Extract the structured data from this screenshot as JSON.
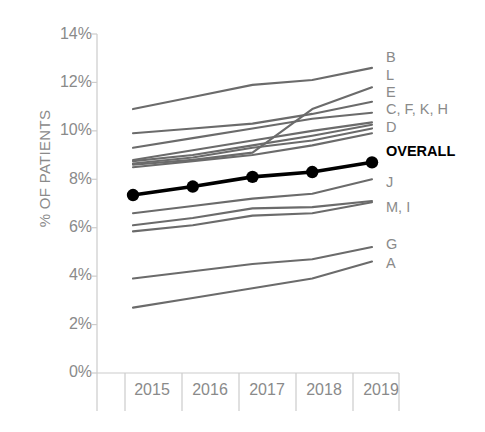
{
  "chart_data": {
    "type": "line",
    "title": "",
    "xlabel": "",
    "ylabel": "% OF PATIENTS",
    "categories": [
      "2015",
      "2016",
      "2017",
      "2018",
      "2019"
    ],
    "x": [
      2015,
      2016,
      2017,
      2018,
      2019
    ],
    "ylim": [
      0,
      14
    ],
    "ytick_labels": [
      "0%",
      "2%",
      "4%",
      "6%",
      "8%",
      "10%",
      "12%",
      "14%"
    ],
    "ytick_values": [
      0,
      2,
      4,
      6,
      8,
      10,
      12,
      14
    ],
    "grid": false,
    "legend_position": "right-inline-labels",
    "units": "percent",
    "series": [
      {
        "name": "B",
        "label": "B",
        "values": [
          10.9,
          11.4,
          11.9,
          12.1,
          12.6
        ],
        "color": "#6b6b6b",
        "highlight": false
      },
      {
        "name": "L",
        "label": "L",
        "values": [
          8.6,
          8.8,
          9.1,
          10.9,
          11.8
        ],
        "color": "#6b6b6b",
        "highlight": false
      },
      {
        "name": "E",
        "label": "E",
        "values": [
          9.9,
          10.1,
          10.3,
          10.7,
          11.2
        ],
        "color": "#6b6b6b",
        "highlight": false
      },
      {
        "name": "C",
        "label": "C, F, K, H",
        "values": [
          9.3,
          9.7,
          10.1,
          10.5,
          10.75
        ],
        "color": "#6b6b6b",
        "highlight": false
      },
      {
        "name": "F",
        "label": "",
        "values": [
          8.8,
          9.2,
          9.6,
          10.0,
          10.35
        ],
        "color": "#6b6b6b",
        "highlight": false
      },
      {
        "name": "K",
        "label": "",
        "values": [
          8.75,
          9.0,
          9.4,
          9.8,
          10.25
        ],
        "color": "#6b6b6b",
        "highlight": false
      },
      {
        "name": "H",
        "label": "",
        "values": [
          8.65,
          8.9,
          9.3,
          9.6,
          10.1
        ],
        "color": "#6b6b6b",
        "highlight": false
      },
      {
        "name": "D",
        "label": "D",
        "values": [
          8.5,
          8.75,
          9.0,
          9.4,
          9.9
        ],
        "color": "#6b6b6b",
        "highlight": false
      },
      {
        "name": "OVERALL",
        "label": "OVERALL",
        "values": [
          7.35,
          7.7,
          8.1,
          8.3,
          8.7
        ],
        "color": "#000000",
        "highlight": true
      },
      {
        "name": "J",
        "label": "J",
        "values": [
          6.6,
          6.9,
          7.2,
          7.4,
          8.0
        ],
        "color": "#6b6b6b",
        "highlight": false
      },
      {
        "name": "M",
        "label": "M, I",
        "values": [
          6.1,
          6.4,
          6.8,
          6.85,
          7.1
        ],
        "color": "#6b6b6b",
        "highlight": false
      },
      {
        "name": "I",
        "label": "",
        "values": [
          5.85,
          6.1,
          6.5,
          6.6,
          7.05
        ],
        "color": "#6b6b6b",
        "highlight": false
      },
      {
        "name": "G",
        "label": "G",
        "values": [
          3.9,
          4.2,
          4.5,
          4.7,
          5.2
        ],
        "color": "#6b6b6b",
        "highlight": false
      },
      {
        "name": "A",
        "label": "A",
        "values": [
          2.7,
          3.1,
          3.5,
          3.9,
          4.6
        ],
        "color": "#6b6b6b",
        "highlight": false
      }
    ],
    "marker_series": "OVERALL",
    "colors": {
      "line_gray": "#6b6b6b",
      "line_highlight": "#000000",
      "axis_text": "#8a8a8a",
      "axis_line": "#cccccc",
      "background": "#ffffff"
    }
  },
  "series_labels": [
    {
      "text": "B",
      "top": 49,
      "highlight": false
    },
    {
      "text": "L",
      "top": 67,
      "highlight": false
    },
    {
      "text": "E",
      "top": 84,
      "highlight": false
    },
    {
      "text": "C, F, K, H",
      "top": 101,
      "highlight": false
    },
    {
      "text": "D",
      "top": 119,
      "highlight": false
    },
    {
      "text": "OVERALL",
      "top": 143,
      "highlight": true
    },
    {
      "text": "J",
      "top": 174,
      "highlight": false
    },
    {
      "text": "M, I",
      "top": 199,
      "highlight": false
    },
    {
      "text": "G",
      "top": 236,
      "highlight": false
    },
    {
      "text": "A",
      "top": 255,
      "highlight": false
    }
  ],
  "y_axis": {
    "title": "% OF PATIENTS",
    "ticks": [
      {
        "label": "14%",
        "top": 25
      },
      {
        "label": "12%",
        "top": 73
      },
      {
        "label": "10%",
        "top": 121
      },
      {
        "label": "8%",
        "top": 170
      },
      {
        "label": "6%",
        "top": 218
      },
      {
        "label": "4%",
        "top": 266
      },
      {
        "label": "2%",
        "top": 315
      },
      {
        "label": "0%",
        "top": 363
      }
    ]
  },
  "x_axis": {
    "ticks": [
      {
        "label": "2015",
        "left": 124
      },
      {
        "label": "2016",
        "left": 182
      },
      {
        "label": "2017",
        "left": 239
      },
      {
        "label": "2018",
        "left": 296
      },
      {
        "label": "2019",
        "left": 353
      }
    ]
  }
}
